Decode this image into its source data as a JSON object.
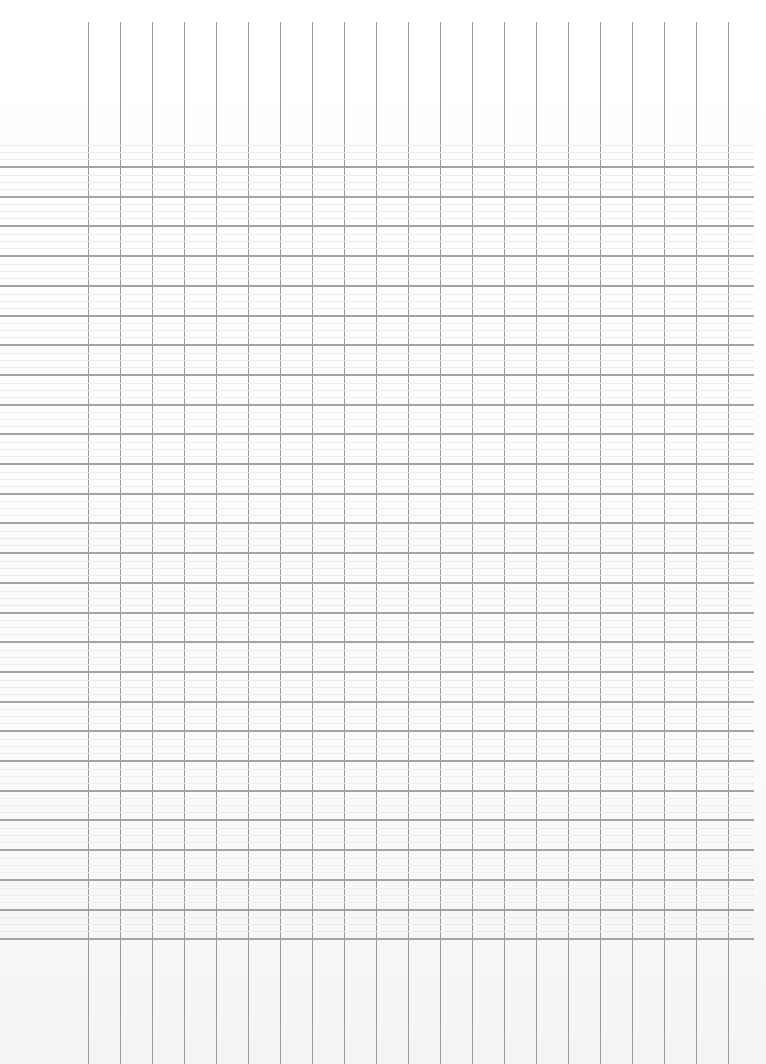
{
  "document": {
    "type": "blank ruled grid sheet (scanned)",
    "background_color": "#fdfdfd",
    "line_color": "#9a9a9a",
    "grid": {
      "vertical_lines": {
        "count": 21,
        "start_x": 88,
        "spacing": 32,
        "top_y": 22,
        "bottom_y": 1064
      },
      "horizontal_lines": {
        "count": 27,
        "start_y": 166,
        "spacing": 29.7,
        "left_x": 0,
        "right_x": 754
      }
    },
    "cells": []
  }
}
